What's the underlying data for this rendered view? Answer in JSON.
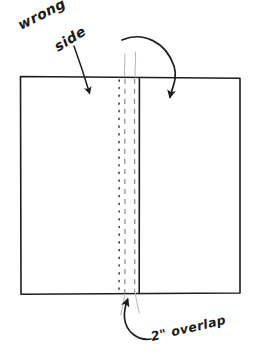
{
  "figure": {
    "kind": "hand-drawn-sewing-diagram",
    "background_color": "#ffffff",
    "ink_color": "#1d1d1d",
    "faint_ink_color": "#9a9a9a",
    "width": 254,
    "height": 357
  },
  "labels": {
    "wrong": "wrong",
    "side": "side",
    "overlap": "2\" overlap"
  },
  "annotations": {
    "wrong_side_label": "wrong side",
    "overlap_label": "2\" overlap"
  },
  "shapes": {
    "fabric_panel": {
      "name": "fabric-rectangle",
      "top_left": [
        20,
        76
      ],
      "top_right": [
        240,
        78
      ],
      "bottom_right": [
        240,
        293
      ],
      "bottom_left": [
        21,
        294
      ]
    },
    "fold_edge_solid": {
      "name": "fold-edge",
      "x": 139,
      "y_top": 78,
      "y_bottom": 293
    },
    "stitch_dotted_line": {
      "name": "stitch-line",
      "x": 119,
      "y_top": 80,
      "y_bottom": 292
    },
    "dashed_line_left": {
      "name": "hem-guide-left",
      "x": 125,
      "y_top": 79,
      "y_bottom": 293
    },
    "dashed_line_right": {
      "name": "hem-guide-right",
      "x": 134,
      "y_top": 79,
      "y_bottom": 292
    }
  },
  "arrows": {
    "left_arrow": {
      "name": "wrong-side-arrow",
      "from": [
        78,
        48
      ],
      "to": [
        90,
        96
      ]
    },
    "curved_arrow": {
      "name": "fold-over-arrow",
      "from": [
        126,
        38
      ],
      "to": [
        170,
        101
      ]
    },
    "overlap_arrow": {
      "name": "overlap-arrow",
      "from": [
        150,
        340
      ],
      "to": [
        128,
        297
      ]
    }
  },
  "colors": {
    "ink": "#1d1d1d",
    "faint": "#9a9a9a",
    "paper": "#ffffff"
  }
}
